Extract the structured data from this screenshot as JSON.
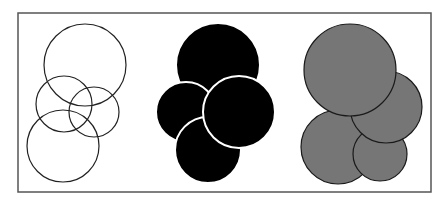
{
  "figure": {
    "width": 448,
    "height": 200,
    "background": "#ffffff",
    "frame": {
      "x": 18,
      "y": 13,
      "w": 413,
      "h": 179,
      "stroke": "#555555"
    },
    "groups": [
      {
        "name": "outline-circles",
        "fill": "none",
        "stroke": "#222222",
        "circles": [
          {
            "cx": 85,
            "cy": 65,
            "r": 41
          },
          {
            "cx": 64,
            "cy": 104,
            "r": 28
          },
          {
            "cx": 94,
            "cy": 112,
            "r": 25
          },
          {
            "cx": 63,
            "cy": 146,
            "r": 36
          }
        ]
      },
      {
        "name": "black-circles",
        "fill": "#000000",
        "stroke": "#ffffff",
        "circles": [
          {
            "cx": 218,
            "cy": 65,
            "r": 42
          },
          {
            "cx": 186,
            "cy": 112,
            "r": 30
          },
          {
            "cx": 208,
            "cy": 150,
            "r": 33
          },
          {
            "cx": 239,
            "cy": 112,
            "r": 36
          }
        ]
      },
      {
        "name": "gray-circles",
        "fill": "#767676",
        "stroke": "#1a1a1a",
        "circles": [
          {
            "cx": 338,
            "cy": 147,
            "r": 37
          },
          {
            "cx": 380,
            "cy": 154,
            "r": 27
          },
          {
            "cx": 386,
            "cy": 107,
            "r": 36
          },
          {
            "cx": 350,
            "cy": 70,
            "r": 46
          }
        ]
      }
    ]
  }
}
